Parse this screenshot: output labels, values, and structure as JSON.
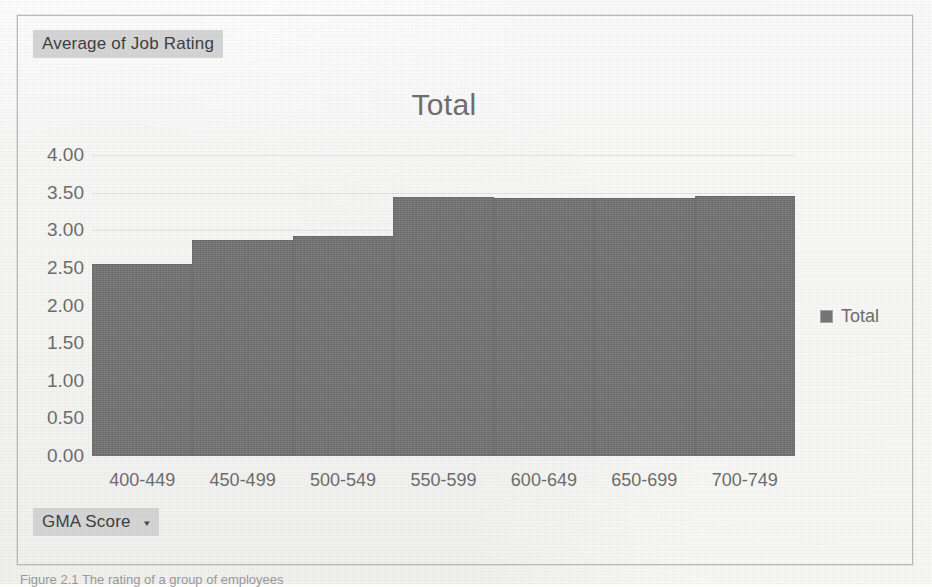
{
  "pivot": {
    "value_field_label": "Average of Job Rating",
    "row_field_label": "GMA Score",
    "row_field_caret": "▾"
  },
  "chart_data": {
    "type": "bar",
    "title": "Total",
    "xlabel": "GMA Score",
    "ylabel": "Average of Job Rating",
    "categories": [
      "400-449",
      "450-499",
      "500-549",
      "550-599",
      "600-649",
      "650-699",
      "700-749"
    ],
    "values": [
      2.55,
      2.87,
      2.93,
      3.44,
      3.43,
      3.43,
      3.46
    ],
    "series": [
      {
        "name": "Total",
        "values": [
          2.55,
          2.87,
          2.93,
          3.44,
          3.43,
          3.43,
          3.46
        ]
      }
    ],
    "ylim": [
      0.0,
      4.0
    ],
    "ytick_step": 0.5,
    "ytick_labels": [
      "4.00",
      "3.50",
      "3.00",
      "2.50",
      "2.00",
      "1.50",
      "1.00",
      "0.50",
      "0.00"
    ],
    "ytick_values": [
      4.0,
      3.5,
      3.0,
      2.5,
      2.0,
      1.5,
      1.0,
      0.5,
      0.0
    ],
    "grid": true,
    "grid_axis": "y",
    "legend": {
      "position": "right",
      "entries": [
        "Total"
      ]
    },
    "bar_color": "#757575",
    "gridline_color": "#e2e2e2",
    "text_color": "#6d6d6d"
  },
  "legend": {
    "label": "Total"
  },
  "caption": {
    "text": "Figure 2.1  The rating of a group of employees"
  }
}
